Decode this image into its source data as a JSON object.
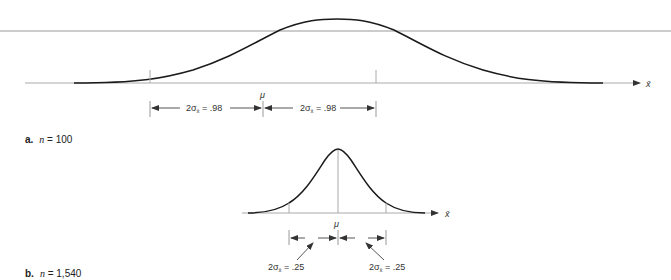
{
  "figure": {
    "panel_a": {
      "letter": "a.",
      "caption_var": "n",
      "caption_rest": " = 100",
      "mean_label": "μ",
      "axis_label": "x̄",
      "left_interval_label": "2σ",
      "left_interval_sub": "x̄",
      "left_interval_value": " = .98",
      "right_interval_label": "2σ",
      "right_interval_sub": "x̄",
      "right_interval_value": " = .98"
    },
    "panel_b": {
      "letter": "b.",
      "caption_var": "n",
      "caption_rest": " = 1,540",
      "mean_label": "μ",
      "axis_label": "x̄",
      "left_interval_label": "2σ",
      "left_interval_sub": "x̄",
      "left_interval_value": " = .25",
      "right_interval_label": "2σ",
      "right_interval_sub": "x̄",
      "right_interval_value": " = .25"
    },
    "colors": {
      "curve": "#1a1a1a",
      "axis": "#999999",
      "guide": "#aaaaaa",
      "text": "#333333"
    }
  }
}
